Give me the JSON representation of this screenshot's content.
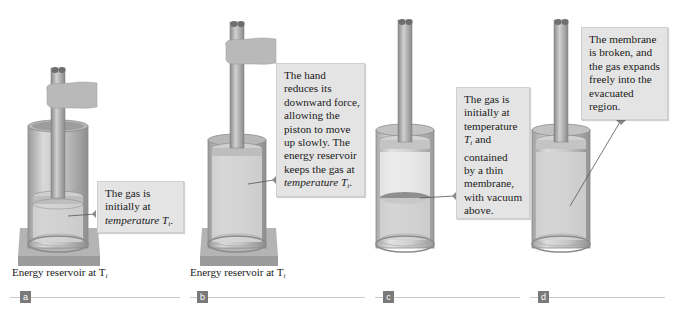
{
  "figure": {
    "panels": [
      {
        "id": "a",
        "label": "a",
        "callout_lines": [
          "The gas is",
          "initially at",
          "temperature T"
        ],
        "callout_subscript": "i",
        "callout_suffix": ".",
        "caption_text": "Energy reservoir at T",
        "caption_subscript": "i",
        "has_hand": true,
        "has_reservoir": true
      },
      {
        "id": "b",
        "label": "b",
        "callout_lines": [
          "The hand",
          "reduces its",
          "downward force,",
          "allowing the",
          "piston to move",
          "up slowly. The",
          "energy reservoir",
          "keeps the gas at",
          "temperature T"
        ],
        "callout_subscript": "i",
        "callout_suffix": ".",
        "caption_text": "Energy reservoir at T",
        "caption_subscript": "i",
        "has_hand": true,
        "has_reservoir": true
      },
      {
        "id": "c",
        "label": "c",
        "callout_lines": [
          "The gas is",
          "initially at",
          "temperature",
          "T",
          "contained",
          "by a thin",
          "membrane,",
          "with vacuum",
          "above."
        ],
        "callout_subscript": "i",
        "callout_inline_suffix": " and",
        "has_hand": false,
        "has_reservoir": false
      },
      {
        "id": "d",
        "label": "d",
        "callout_lines": [
          "The membrane",
          "is broken, and",
          "the gas expands",
          "freely into the",
          "evacuated",
          "region."
        ],
        "has_hand": false,
        "has_reservoir": false
      }
    ]
  },
  "colors": {
    "callout_bg": "#e4e4e4",
    "badge_bg": "#7a7a7a",
    "divider": "#c9c9c9",
    "cylinder": "#c4c4c4",
    "gas": "#d6d6d6",
    "reservoir": "#a9a9a9"
  }
}
